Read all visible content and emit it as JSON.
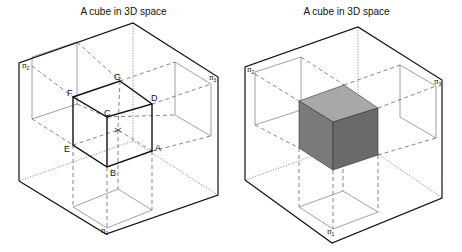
{
  "figures": [
    {
      "title": "A cube in 3D space",
      "style": "wireframe",
      "vertex_labels": {
        "A": "A",
        "B": "B",
        "C": "C",
        "D": "D",
        "E": "E",
        "F": "F",
        "G": "G"
      },
      "plane_labels": {
        "pi1": "π",
        "pi1_sub": "1",
        "pi2": "π",
        "pi2_sub": "2",
        "pi3": "π",
        "pi3_sub": "3"
      }
    },
    {
      "title": "A cube in 3D space",
      "style": "shaded",
      "plane_labels": {
        "pi1": "π",
        "pi1_sub": "1",
        "pi2": "π",
        "pi2_sub": "2",
        "pi3": "π",
        "pi3_sub": "3"
      },
      "face_colors": {
        "top": "#a8a8a8",
        "front_left": "#7a7a7a",
        "front_right": "#6a6a6a"
      }
    }
  ]
}
